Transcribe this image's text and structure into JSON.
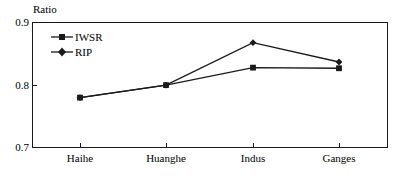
{
  "chart_data": {
    "type": "line",
    "title": "",
    "ylabel": "Ratio",
    "xlabel": "",
    "categories": [
      "Haihe",
      "Huanghe",
      "Indus",
      "Ganges"
    ],
    "series": [
      {
        "name": "IWSR",
        "marker": "square",
        "values": [
          0.779,
          0.799,
          0.827,
          0.826
        ]
      },
      {
        "name": "RIP",
        "marker": "diamond",
        "values": [
          0.779,
          0.799,
          0.867,
          0.836
        ]
      }
    ],
    "ylim": [
      0.7,
      0.9
    ],
    "yticks": [
      "0.9",
      "0.8",
      "0.7"
    ],
    "ytick_values": [
      0.9,
      0.8,
      0.7
    ],
    "grid": false,
    "legend_position": "top-left-inside",
    "line_color": "#1a1a1a"
  },
  "axis": {
    "y_title": "Ratio",
    "y_tick_labels": [
      "0.9",
      "0.8",
      "0.7"
    ],
    "x_tick_labels": [
      "Haihe",
      "Huanghe",
      "Indus",
      "Ganges"
    ]
  },
  "legend": {
    "entries": [
      {
        "label": "IWSR"
      },
      {
        "label": "RIP"
      }
    ]
  }
}
